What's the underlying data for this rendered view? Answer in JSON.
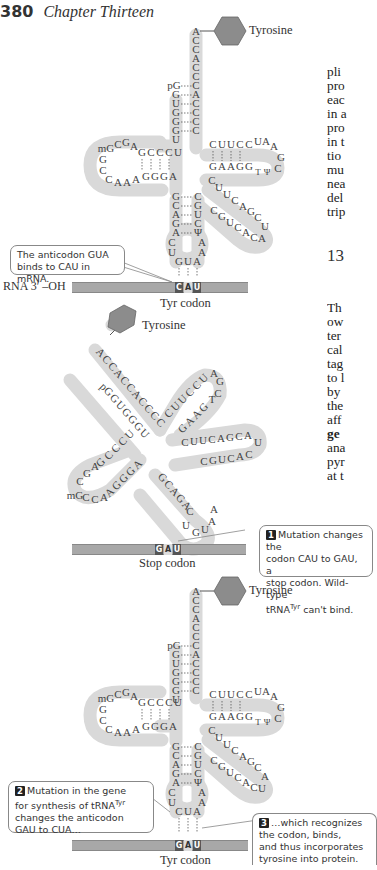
{
  "header": {
    "page_number": "380",
    "chapter": "Chapter Thirteen"
  },
  "body_text": {
    "lines_top": [
      "pli",
      "pro",
      "eac",
      "in a",
      "pro",
      "in t",
      "tio",
      "mu",
      "nea",
      "del",
      "trip"
    ],
    "section_heading": "13",
    "lines_bottom": [
      "Th",
      "ow",
      "ter",
      "cal",
      "tag",
      "to l",
      "by",
      "the",
      "aff",
      "ge",
      "ana",
      "pyr",
      "at t"
    ]
  },
  "panels": [
    {
      "id": "wild-type",
      "amino_acid": "Tyrosine",
      "acceptor_stem_3prime": [
        "A",
        "C",
        "C",
        "A",
        "C",
        "C",
        "A",
        "C",
        "C",
        "C",
        "C"
      ],
      "acceptor_stem_5prime": [
        "pG",
        "G",
        "U",
        "G",
        "G",
        "G",
        "U"
      ],
      "d_arm_top": "GCCCU",
      "d_arm_loop": "mGCGA CCAAA",
      "d_arm_bottom": "AGGGA",
      "t_arm_top": "CUUCC",
      "t_arm_loop": "UAAGC",
      "t_arm_bottom": "GAAGG TΨC",
      "variable_arm": "CUUCAGCUACACUGC",
      "anticodon_stem_left": [
        "G",
        "C",
        "A",
        "G",
        "A"
      ],
      "anticodon_stem_right": [
        "C",
        "G",
        "U",
        "C",
        "Ψ"
      ],
      "anticodon_loop": [
        "C",
        "U",
        "A",
        "A"
      ],
      "anticodon": "GUA",
      "mrna_label": "RNA 3′ –OH",
      "codon": [
        "C",
        "A",
        "U"
      ],
      "codon_label": "Tyr codon",
      "callout": "The anticodon GUA binds to CAU in mRNA."
    },
    {
      "id": "mutant-codon",
      "amino_acid": "Tyrosine",
      "codon": [
        "G",
        "A",
        "U"
      ],
      "codon_label": "Stop codon",
      "callout_number": "1",
      "callout_line1": "Mutation changes the",
      "callout_line2": "codon CAU to GAU, a",
      "callout_line3": "stop codon. Wild-type",
      "callout_line4a": "tRNA",
      "callout_line4sup": "Tyr",
      "callout_line4b": " can't bind."
    },
    {
      "id": "suppressor",
      "amino_acid": "Tyrosine",
      "anticodon": "CUA",
      "codon": [
        "G",
        "A",
        "U"
      ],
      "codon_label": "Tyr codon",
      "callout2_number": "2",
      "callout2_line1": "Mutation in the gene",
      "callout2_line2a": "for synthesis of tRNA",
      "callout2_line2sup": "Tyr",
      "callout2_line3": "changes the anticodon",
      "callout2_line4": "GAU to CUA…",
      "callout3_number": "3",
      "callout3_line1": "…which recognizes",
      "callout3_line2": "the codon, binds,",
      "callout3_line3": "and thus incorporates",
      "callout3_line4": "tyrosine into protein."
    }
  ],
  "colors": {
    "trna_backbone": "#d9d9d9",
    "amino_acid_hexagon": "#8c8c8c",
    "mrna_bar": "#a8a8a8",
    "codon_dark": "#555555"
  }
}
